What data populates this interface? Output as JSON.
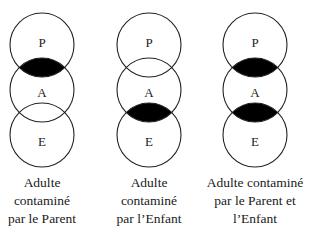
{
  "diagram": {
    "circle_labels": {
      "top": "P",
      "middle": "A",
      "bottom": "E"
    },
    "colors": {
      "stroke": "#222222",
      "fill_contamination": "#000000",
      "background": "#ffffff"
    },
    "panels": [
      {
        "center_x": 42,
        "contamination": [
          "P-A"
        ],
        "caption": [
          "Adulte",
          "contaminé",
          "par le Parent"
        ]
      },
      {
        "center_x": 149,
        "contamination": [
          "A-E"
        ],
        "caption": [
          "Adulte",
          "contaminé",
          "par l’Enfant"
        ]
      },
      {
        "center_x": 255,
        "contamination": [
          "P-A",
          "A-E"
        ],
        "caption": [
          "Adulte contaminé",
          "par le Parent et",
          "l’Enfant"
        ]
      }
    ]
  }
}
